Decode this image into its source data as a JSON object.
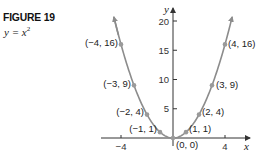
{
  "figure": {
    "title": "FIGURE 19",
    "equation_base": "y = x",
    "equation_exp": "2"
  },
  "colors": {
    "curve": "#8c8c8c",
    "point": "#9a9a9a",
    "axis": "#333333",
    "text": "#222222"
  },
  "chart_data": {
    "type": "line",
    "title": "FIGURE 19",
    "subtitle": "y = x^2",
    "xlabel": "x",
    "ylabel": "y",
    "xlim": [
      -5.5,
      5.9
    ],
    "ylim": [
      0,
      22
    ],
    "x_ticks": [
      -4,
      4
    ],
    "x_tick_labels": [
      "−4",
      "4"
    ],
    "y_ticks": [
      5,
      10,
      15,
      20
    ],
    "y_tick_labels": [
      "5",
      "10",
      "15",
      "20"
    ],
    "grid": false,
    "legend": null,
    "series": [
      {
        "name": "y = x^2",
        "x": [
          -4,
          -3,
          -2,
          -1,
          0,
          1,
          2,
          3,
          4
        ],
        "values": [
          16,
          9,
          4,
          1,
          0,
          1,
          4,
          9,
          16
        ]
      }
    ],
    "annotations": [
      {
        "x": -4,
        "y": 16,
        "text": "(−4, 16)"
      },
      {
        "x": -3,
        "y": 9,
        "text": "(−3, 9)"
      },
      {
        "x": -2,
        "y": 4,
        "text": "(−2, 4)"
      },
      {
        "x": -1,
        "y": 1,
        "text": "(−1, 1)"
      },
      {
        "x": 0,
        "y": 0,
        "text": "(0, 0)"
      },
      {
        "x": 1,
        "y": 1,
        "text": "(1, 1)"
      },
      {
        "x": 2,
        "y": 4,
        "text": "(2, 4)"
      },
      {
        "x": 3,
        "y": 9,
        "text": "(3, 9)"
      },
      {
        "x": 4,
        "y": 16,
        "text": "(4, 16)"
      }
    ]
  }
}
